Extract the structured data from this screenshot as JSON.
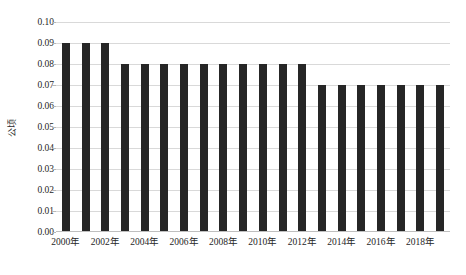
{
  "chart_data": {
    "type": "bar",
    "title": "",
    "subtitle": "",
    "xlabel": "",
    "ylabel": "公顷",
    "ylim": [
      0.0,
      0.1
    ],
    "ytick_step": 0.01,
    "grid": true,
    "legend": false,
    "legend_position": "none",
    "bar_color": "#262626",
    "gridline_color": "#d9d9d9",
    "background_color": "#ffffff",
    "categories": [
      "2000年",
      "2001年",
      "2002年",
      "2003年",
      "2004年",
      "2005年",
      "2006年",
      "2007年",
      "2008年",
      "2009年",
      "2010年",
      "2011年",
      "2012年",
      "2013年",
      "2014年",
      "2015年",
      "2016年",
      "2017年",
      "2018年",
      "2019年"
    ],
    "values": [
      0.09,
      0.09,
      0.09,
      0.08,
      0.08,
      0.08,
      0.08,
      0.08,
      0.08,
      0.08,
      0.08,
      0.08,
      0.08,
      0.07,
      0.07,
      0.07,
      0.07,
      0.07,
      0.07,
      0.07
    ],
    "ytick_labels": [
      "0.10",
      "0.09",
      "0.08",
      "0.07",
      "0.06",
      "0.05",
      "0.04",
      "0.03",
      "0.02",
      "0.01",
      "0.00"
    ],
    "ytick_values": [
      0.1,
      0.09,
      0.08,
      0.07,
      0.06,
      0.05,
      0.04,
      0.03,
      0.02,
      0.01,
      0.0
    ],
    "xtick_labels": [
      "2000年",
      "2002年",
      "2004年",
      "2006年",
      "2008年",
      "2010年",
      "2012年",
      "2014年",
      "2016年",
      "2018年"
    ],
    "xtick_indices": [
      0,
      2,
      4,
      6,
      8,
      10,
      12,
      14,
      16,
      18
    ]
  },
  "top_remnant": {
    "text": ""
  }
}
